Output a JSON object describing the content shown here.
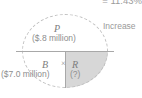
{
  "diagram": {
    "title_formula": "= 11.43%",
    "annotation_increase": "Increase",
    "operator_multiply": "×",
    "parts": {
      "percentage": {
        "symbol": "P",
        "value": "($.8 million)"
      },
      "base": {
        "symbol": "B",
        "value": "($7.0 million)"
      },
      "rate": {
        "symbol": "R",
        "value": "(?)"
      }
    }
  },
  "chart_data": {
    "type": "pie",
    "title": "= 11.43%",
    "categories": [
      "P",
      "B",
      "R"
    ],
    "labels": [
      "($.8 million)",
      "($7.0 million)",
      "(?)"
    ],
    "values": [
      50,
      25,
      25
    ],
    "annotations": [
      "Increase",
      "×"
    ],
    "xlabel": "",
    "ylabel": "",
    "legend": "none",
    "grid": false
  },
  "colors": {
    "shade": "#d7d7d7",
    "line": "#a8a8a8",
    "outline": "#c0c0c0",
    "text": "#8a8a8a"
  }
}
